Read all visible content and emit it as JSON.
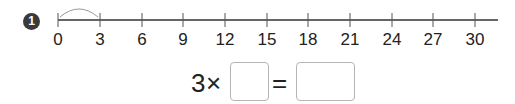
{
  "problem": {
    "number": "1",
    "number_line": {
      "ticks": [
        "0",
        "3",
        "6",
        "9",
        "12",
        "15",
        "18",
        "21",
        "24",
        "27",
        "30"
      ],
      "start": 0,
      "end": 30,
      "step": 3,
      "arc": {
        "from": "0",
        "to": "3"
      }
    },
    "equation": {
      "multiplicand": "3",
      "times_sign": "×",
      "equals_sign": "=",
      "box1_value": "",
      "box2_value": ""
    }
  }
}
